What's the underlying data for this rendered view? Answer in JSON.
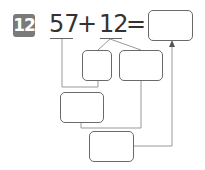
{
  "problem": {
    "number": "12",
    "operand1": "57",
    "operator": "+",
    "operand2": "12",
    "equals": "=",
    "result": ""
  },
  "boxes": {
    "result_box": "",
    "box_tens_of_12": "",
    "box_ones_of_12": "",
    "box_partial_sum": "",
    "box_final_sum": ""
  },
  "colors": {
    "badge_bg": "#7a7a7a",
    "line": "#999999",
    "box_border": "#6a6a6a"
  }
}
